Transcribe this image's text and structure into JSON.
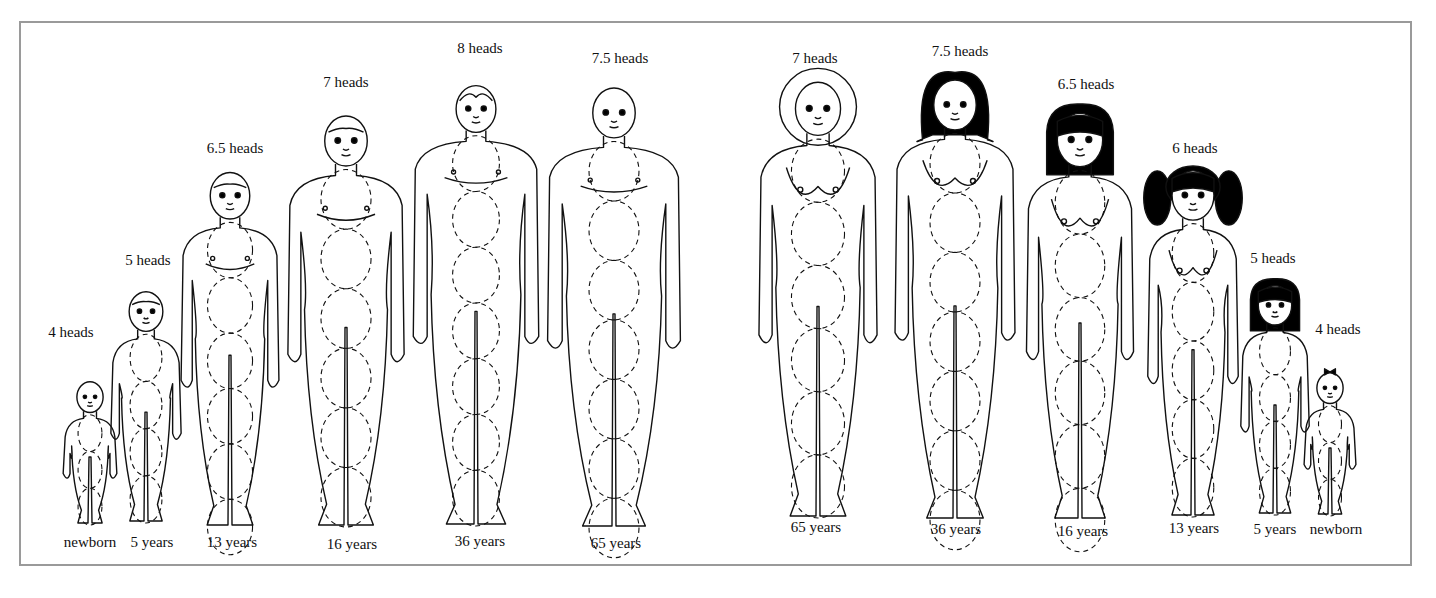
{
  "diagram": {
    "frame_color": "#9a9a9a",
    "line_color": "#111111",
    "hair_color": "#000000",
    "male": [
      {
        "id": "male-newborn",
        "heads": "4 heads",
        "age": "newborn",
        "cx": 90,
        "top": 378,
        "bottom": 525,
        "width": 54,
        "hair": "none",
        "heads_label_x": 71,
        "heads_label_y": 332,
        "age_label_x": 90,
        "age_label_y": 542
      },
      {
        "id": "male-5",
        "heads": "5 heads",
        "age": "5 years",
        "cx": 146,
        "top": 287,
        "bottom": 523,
        "width": 72,
        "hair": "short",
        "heads_label_x": 148,
        "heads_label_y": 260,
        "age_label_x": 152,
        "age_label_y": 542
      },
      {
        "id": "male-13",
        "heads": "6.5 heads",
        "age": "13 years",
        "cx": 230,
        "top": 167,
        "bottom": 527,
        "width": 102,
        "hair": "short",
        "heads_label_x": 235,
        "heads_label_y": 148,
        "age_label_x": 232,
        "age_label_y": 542
      },
      {
        "id": "male-16",
        "heads": "7 heads",
        "age": "16 years",
        "cx": 346,
        "top": 110,
        "bottom": 527,
        "width": 122,
        "hair": "short",
        "heads_label_x": 346,
        "heads_label_y": 82,
        "age_label_x": 352,
        "age_label_y": 544
      },
      {
        "id": "male-36",
        "heads": "8 heads",
        "age": "36 years",
        "cx": 476,
        "top": 80,
        "bottom": 526,
        "width": 132,
        "hair": "receding",
        "heads_label_x": 480,
        "heads_label_y": 48,
        "age_label_x": 480,
        "age_label_y": 541
      },
      {
        "id": "male-65",
        "heads": "7.5 heads",
        "age": "65 years",
        "cx": 614,
        "top": 82,
        "bottom": 528,
        "width": 140,
        "hair": "bald",
        "heads_label_x": 620,
        "heads_label_y": 58,
        "age_label_x": 616,
        "age_label_y": 543
      }
    ],
    "female": [
      {
        "id": "female-65",
        "heads": "7 heads",
        "age": "65 years",
        "cx": 818,
        "top": 76,
        "bottom": 518,
        "width": 124,
        "hair": "bob-white",
        "heads_label_x": 815,
        "heads_label_y": 58,
        "age_label_x": 816,
        "age_label_y": 527
      },
      {
        "id": "female-36",
        "heads": "7.5 heads",
        "age": "36 years",
        "cx": 955,
        "top": 74,
        "bottom": 520,
        "width": 126,
        "hair": "flip-black",
        "heads_label_x": 960,
        "heads_label_y": 51,
        "age_label_x": 956,
        "age_label_y": 529
      },
      {
        "id": "female-16",
        "heads": "6.5 heads",
        "age": "16 years",
        "cx": 1080,
        "top": 107,
        "bottom": 520,
        "width": 112,
        "hair": "bob-black",
        "heads_label_x": 1086,
        "heads_label_y": 84,
        "age_label_x": 1083,
        "age_label_y": 531
      },
      {
        "id": "female-13",
        "heads": "6 heads",
        "age": "13 years",
        "cx": 1193,
        "top": 165,
        "bottom": 517,
        "width": 94,
        "hair": "pigtails",
        "heads_label_x": 1195,
        "heads_label_y": 148,
        "age_label_x": 1194,
        "age_label_y": 528
      },
      {
        "id": "female-5",
        "heads": "5 heads",
        "age": "5 years",
        "cx": 1275,
        "top": 281,
        "bottom": 515,
        "width": 70,
        "hair": "bob-black",
        "heads_label_x": 1273,
        "heads_label_y": 258,
        "age_label_x": 1275,
        "age_label_y": 529
      },
      {
        "id": "female-newborn",
        "heads": "4 heads",
        "age": "newborn",
        "cx": 1330,
        "top": 369,
        "bottom": 516,
        "width": 52,
        "hair": "bow",
        "heads_label_x": 1338,
        "heads_label_y": 329,
        "age_label_x": 1336,
        "age_label_y": 529
      }
    ]
  }
}
